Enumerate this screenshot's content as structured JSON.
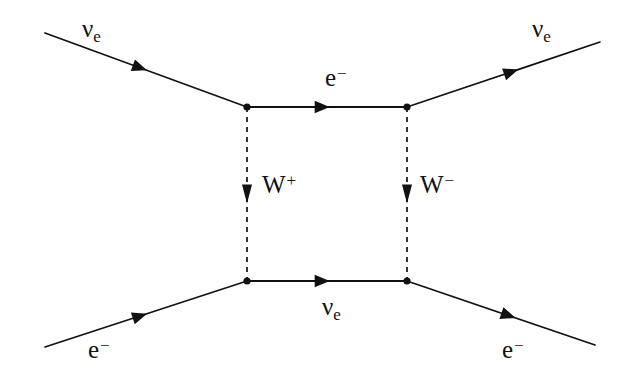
{
  "figure": {
    "kind": "feynman-diagram",
    "background_color": "#ffffff",
    "line_color": "#111111",
    "canvas": {
      "width": 626,
      "height": 380
    }
  },
  "labels": {
    "incoming_neutrino": {
      "symbol": "ν",
      "subscript": "e",
      "superscript": ""
    },
    "outgoing_neutrino": {
      "symbol": "ν",
      "subscript": "e",
      "superscript": ""
    },
    "incoming_electron": {
      "symbol": "e",
      "subscript": "",
      "superscript": "−"
    },
    "outgoing_electron": {
      "symbol": "e",
      "subscript": "",
      "superscript": "−"
    },
    "internal_electron": {
      "symbol": "e",
      "subscript": "",
      "superscript": "−"
    },
    "internal_neutrino": {
      "symbol": "ν",
      "subscript": "e",
      "superscript": ""
    },
    "w_plus": {
      "symbol": "W",
      "subscript": "",
      "superscript": "+"
    },
    "w_minus": {
      "symbol": "W",
      "subscript": "",
      "superscript": "−"
    }
  },
  "label_positions": {
    "incoming_neutrino": {
      "left": 82,
      "top": 16
    },
    "outgoing_neutrino": {
      "left": 532,
      "top": 16
    },
    "incoming_electron": {
      "left": 88,
      "top": 337
    },
    "outgoing_electron": {
      "left": 502,
      "top": 337
    },
    "internal_electron": {
      "left": 325,
      "top": 65
    },
    "internal_neutrino": {
      "left": 322,
      "top": 294
    },
    "w_plus": {
      "left": 262,
      "top": 172
    },
    "w_minus": {
      "left": 420,
      "top": 172
    }
  },
  "geometry": {
    "vertices": [
      {
        "name": "top-left",
        "x": 247,
        "y": 107
      },
      {
        "name": "top-right",
        "x": 407,
        "y": 107
      },
      {
        "name": "bottom-left",
        "x": 247,
        "y": 281
      },
      {
        "name": "bottom-right",
        "x": 407,
        "y": 281
      }
    ],
    "external_lines": [
      {
        "name": "incoming-neutrino-line",
        "x1": 45,
        "y1": 33,
        "x2": 247,
        "y2": 107,
        "arrow_t": 0.47,
        "style": "solid"
      },
      {
        "name": "outgoing-neutrino-line",
        "x1": 407,
        "y1": 107,
        "x2": 600,
        "y2": 42,
        "arrow_t": 0.54,
        "style": "solid"
      },
      {
        "name": "incoming-electron-line",
        "x1": 45,
        "y1": 347,
        "x2": 247,
        "y2": 281,
        "arrow_t": 0.47,
        "style": "solid"
      },
      {
        "name": "outgoing-electron-line",
        "x1": 407,
        "y1": 281,
        "x2": 595,
        "y2": 345,
        "arrow_t": 0.54,
        "style": "solid"
      }
    ],
    "internal_lines": [
      {
        "name": "internal-electron-line",
        "x1": 247,
        "y1": 107,
        "x2": 407,
        "y2": 107,
        "arrow_t": 0.47,
        "style": "solid"
      },
      {
        "name": "internal-neutrino-line",
        "x1": 247,
        "y1": 281,
        "x2": 407,
        "y2": 281,
        "arrow_t": 0.47,
        "style": "solid"
      }
    ],
    "propagators": [
      {
        "name": "w-plus-propagator",
        "x1": 247,
        "y1": 107,
        "x2": 247,
        "y2": 281,
        "arrow_t": 0.5,
        "style": "dashed"
      },
      {
        "name": "w-minus-propagator",
        "x1": 407,
        "y1": 107,
        "x2": 407,
        "y2": 281,
        "arrow_t": 0.5,
        "style": "dashed"
      }
    ]
  }
}
